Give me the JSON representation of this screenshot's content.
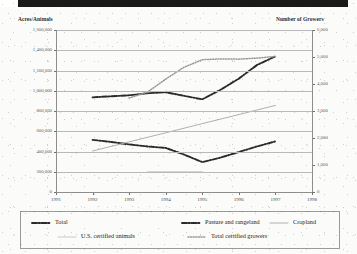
{
  "figure": {
    "left_axis_title": "Acres/Animals",
    "right_axis_title": "Number of Growers"
  },
  "chart_data": {
    "type": "line",
    "title": "",
    "subtitle": "",
    "xlabel": "",
    "ylabel": "Acres/Animals",
    "y2label": "Number of Growers",
    "grid": true,
    "legend_position": "bottom",
    "x": [
      1991,
      1992,
      1993,
      1994,
      1995,
      1996,
      1997,
      1998
    ],
    "xtick_labels": [
      "1991",
      "1992",
      "1993",
      "1994",
      "1995",
      "1996",
      "1997",
      "1998"
    ],
    "xlim": [
      1991,
      1998
    ],
    "ylim": [
      0,
      1600000
    ],
    "ytick_labels": [
      "0",
      "200,000",
      "400,000",
      "600,000",
      "800,000",
      "1,000,000",
      "1,200,000",
      "1,400,000",
      "1,600,000"
    ],
    "yticks": [
      0,
      200000,
      400000,
      600000,
      800000,
      1000000,
      1200000,
      1400000,
      1600000
    ],
    "y2lim": [
      0,
      6000
    ],
    "y2tick_labels": [
      "0",
      "1,000",
      "2,000",
      "3,000",
      "4,000",
      "5,000",
      "6,000"
    ],
    "y2ticks": [
      0,
      1000,
      2000,
      3000,
      4000,
      5000,
      6000
    ],
    "series": [
      {
        "name": "Total",
        "axis": "left",
        "style": "dash-dot",
        "color": "#2a2a2a",
        "x": [
          1992,
          1992.5,
          1993,
          1993.5,
          1994,
          1994.5,
          1995,
          1995.5,
          1996,
          1996.5,
          1997
        ],
        "values": [
          935000,
          945000,
          955000,
          975000,
          985000,
          950000,
          915000,
          1010000,
          1120000,
          1255000,
          1340000
        ]
      },
      {
        "name": "Pasture and rangeland",
        "axis": "left",
        "style": "dash-dot",
        "color": "#2a2a2a",
        "x": [
          1992,
          1992.5,
          1993,
          1993.5,
          1994,
          1994.5,
          1995,
          1995.5,
          1996,
          1996.5,
          1997
        ],
        "values": [
          515000,
          495000,
          470000,
          450000,
          435000,
          370000,
          295000,
          340000,
          395000,
          450000,
          500000
        ]
      },
      {
        "name": "Cropland",
        "axis": "left",
        "style": "solid",
        "color": "#b0b0b0",
        "x": [
          1992,
          1997
        ],
        "values": [
          405000,
          855000
        ]
      },
      {
        "name": "U.S. certified animals",
        "axis": "left",
        "style": "solid",
        "color": "#c9c9c9",
        "x": [
          1993.5,
          1995
        ],
        "values": [
          200000,
          200000
        ]
      },
      {
        "name": "Total certified growers",
        "axis": "right",
        "style": "dotted",
        "color": "#9a9a9a",
        "x": [
          1993,
          1993.5,
          1994,
          1994.5,
          1995,
          1995.5,
          1996,
          1996.5,
          1997
        ],
        "values": [
          3480,
          3700,
          4180,
          4620,
          4900,
          4930,
          4920,
          4960,
          5020
        ]
      }
    ]
  },
  "legend": {
    "rows": [
      [
        {
          "label": "Total",
          "style": "dash-dot",
          "color": "#2a2a2a"
        },
        {
          "label": "Pasture and rangeland",
          "style": "dash-dot",
          "color": "#2a2a2a"
        },
        {
          "label": "Cropland",
          "style": "solid",
          "color": "#b0b0b0"
        }
      ],
      [
        {
          "label": "U.S. certified animals",
          "style": "solid",
          "color": "#c9c9c9"
        },
        {
          "label": "Total certified growers",
          "style": "dotted",
          "color": "#9a9a9a"
        }
      ]
    ]
  }
}
